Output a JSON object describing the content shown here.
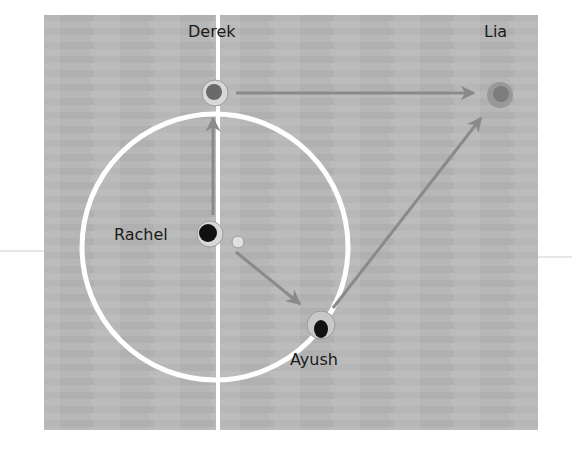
{
  "diagram": {
    "title": "",
    "court": {
      "background": "#b5b5b5",
      "line_color": "#ffffff",
      "arrow_color": "#7a7a7a"
    },
    "players": [
      {
        "name": "Derek",
        "x": 215,
        "y": 88,
        "label_x": 188,
        "label_y": 42
      },
      {
        "name": "Lia",
        "x": 497,
        "y": 96,
        "label_x": 484,
        "label_y": 42
      },
      {
        "name": "Rachel",
        "x": 211,
        "y": 236,
        "label_x": 114,
        "label_y": 225
      },
      {
        "name": "Ayush",
        "x": 321,
        "y": 328,
        "label_x": 290,
        "label_y": 352
      }
    ],
    "passes": [
      {
        "from": "Rachel",
        "to": "Derek"
      },
      {
        "from": "Derek",
        "to": "Lia"
      },
      {
        "from": "Rachel",
        "to": "Ayush"
      },
      {
        "from": "Ayush",
        "to": "Lia"
      }
    ]
  }
}
